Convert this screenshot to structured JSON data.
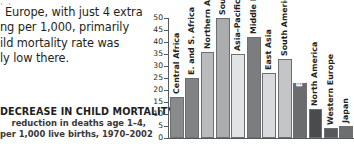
{
  "article": {
    "lines": [
      "t t",
      "Europe, with just 4 extra",
      "ng per 1,000, primarily",
      "ild mortality rate was",
      "ly low there."
    ]
  },
  "caption": {
    "title": "DECREASE IN CHILD MORTALITY",
    "subtitle_line1": "reduction in deaths age 1–4,",
    "subtitle_line2": "per 1,000 live births, 1970–2002"
  },
  "chart_data": {
    "type": "bar",
    "title": "DECREASE IN CHILD MORTALITY",
    "subtitle": "reduction in deaths age 1–4, per 1,000 live births, 1970–2002",
    "xlabel": "",
    "ylabel": "",
    "ylim": [
      0,
      50
    ],
    "grid": false,
    "legend": "none",
    "orientation": "vertical",
    "tick_labels": [
      "50",
      "45",
      "40",
      "35",
      "30",
      "25",
      "20",
      "15",
      "10",
      "5",
      "0"
    ],
    "tick_values": [
      50,
      45,
      40,
      35,
      30,
      25,
      20,
      15,
      10,
      5,
      0
    ],
    "categories": [
      "Central Africa",
      "E. and S. Africa",
      "Northern Africa",
      "South Asia",
      "Asia–Pacific",
      "Middle East",
      "East Asia",
      "South America",
      "Eastern Europe",
      "North America",
      "Western Europe",
      "Japan"
    ],
    "values": [
      17,
      25,
      36,
      50,
      35,
      42,
      27,
      33,
      23,
      12,
      4,
      5
    ],
    "colors": [
      "#888a8c",
      "#808284",
      "#b9bbbd",
      "#aaacae",
      "#e2e3e4",
      "#7b7d7f",
      "#d9dadb",
      "#c3c5c7",
      "#6a6c6e",
      "#4a4b4d",
      "#58595b",
      "#6d6e70"
    ],
    "label_placement": [
      "above",
      "above",
      "above",
      "above",
      "above",
      "above",
      "above",
      "above",
      "inside",
      "above",
      "above",
      "above"
    ]
  }
}
